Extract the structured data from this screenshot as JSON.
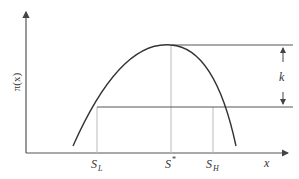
{
  "diagram": {
    "y_axis_label": "π(x)",
    "x_axis_label": "x",
    "gap_label": "k",
    "ticks": [
      {
        "main": "S",
        "sub": "L",
        "x": 97
      },
      {
        "main": "S",
        "sup": "*",
        "x": 171
      },
      {
        "main": "S",
        "sub": "H",
        "x": 213
      }
    ],
    "colors": {
      "axis": "#555555",
      "curve": "#333333",
      "guide": "#bbbbbb",
      "text": "#333333"
    }
  }
}
